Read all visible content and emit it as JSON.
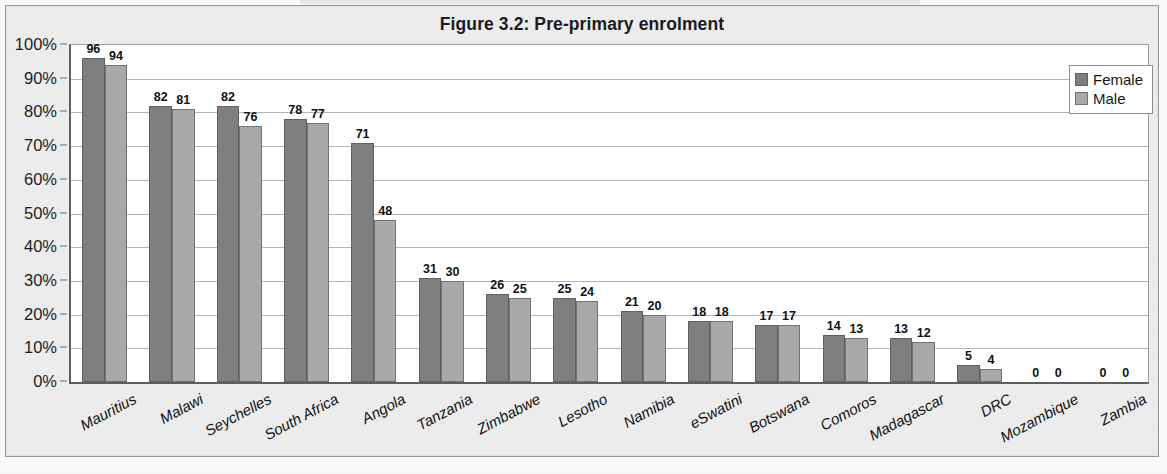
{
  "chart_data": {
    "type": "bar",
    "title": "Figure 3.2: Pre-primary enrolment",
    "xlabel": "",
    "ylabel": "",
    "ylim": [
      0,
      100
    ],
    "grid": true,
    "legend_position": "top-right",
    "y_tick_labels": [
      "100%",
      "90%",
      "80%",
      "70%",
      "60%",
      "50%",
      "40%",
      "30%",
      "20%",
      "10%",
      "0%"
    ],
    "y_tick_values": [
      100,
      90,
      80,
      70,
      60,
      50,
      40,
      30,
      20,
      10,
      0
    ],
    "categories": [
      "Mauritius",
      "Malawi",
      "Seychelles",
      "South Africa",
      "Angola",
      "Tanzania",
      "Zimbabwe",
      "Lesotho",
      "Namibia",
      "eSwatini",
      "Botswana",
      "Comoros",
      "Madagascar",
      "DRC",
      "Mozambique",
      "Zambia"
    ],
    "series": [
      {
        "name": "Female",
        "color": "#7f7f7f",
        "values": [
          96,
          82,
          82,
          78,
          71,
          31,
          26,
          25,
          21,
          18,
          17,
          14,
          13,
          5,
          0,
          0
        ]
      },
      {
        "name": "Male",
        "color": "#a9a9a9",
        "values": [
          94,
          81,
          76,
          77,
          48,
          30,
          25,
          24,
          20,
          18,
          17,
          13,
          12,
          4,
          0,
          0
        ]
      }
    ]
  },
  "legend": {
    "items": [
      {
        "label": "Female",
        "swatch": "female"
      },
      {
        "label": "Male",
        "swatch": "male"
      }
    ]
  }
}
